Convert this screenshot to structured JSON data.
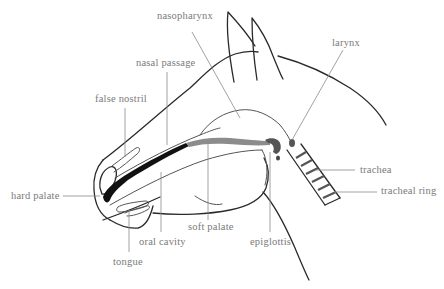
{
  "diagram": {
    "colors": {
      "background": "#ffffff",
      "outline": "#2a2a2a",
      "label_text": "#7a7a7a",
      "leader_line": "#8a8a8a",
      "hard_palate_fill": "#111111",
      "soft_palate_fill": "#8c8c8c",
      "epiglottis_fill": "#555555"
    },
    "labels": [
      {
        "id": "nasopharynx",
        "text": "nasopharynx",
        "x": 157,
        "y": 18
      },
      {
        "id": "nasal_passage",
        "text": "nasal passage",
        "x": 136,
        "y": 58
      },
      {
        "id": "false_nostril",
        "text": "false nostril",
        "x": 95,
        "y": 95
      },
      {
        "id": "larynx",
        "text": "larynx",
        "x": 332,
        "y": 37
      },
      {
        "id": "hard_palate",
        "text": "hard palate",
        "x": 11,
        "y": 192
      },
      {
        "id": "trachea",
        "text": "trachea",
        "x": 360,
        "y": 166
      },
      {
        "id": "tracheal_ring",
        "text": "tracheal ring",
        "x": 381,
        "y": 187
      },
      {
        "id": "soft_palate",
        "text": "soft palate",
        "x": 188,
        "y": 225
      },
      {
        "id": "epiglottis",
        "text": "epiglottis",
        "x": 250,
        "y": 236
      },
      {
        "id": "oral_cavity",
        "text": "oral cavity",
        "x": 139,
        "y": 236
      },
      {
        "id": "tongue",
        "text": "tongue",
        "x": 113,
        "y": 256
      }
    ]
  }
}
